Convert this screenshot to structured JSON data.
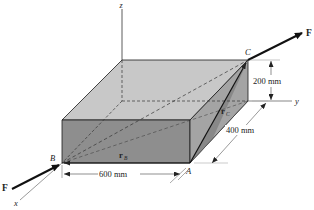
{
  "figure": {
    "type": "3D statics vector diagram"
  },
  "axes": {
    "x_label": "x",
    "y_label": "y",
    "z_label": "z"
  },
  "points": {
    "A": "A",
    "B": "B",
    "C": "C"
  },
  "vectors": {
    "rB_main": "r",
    "rB_sub": "B",
    "rC_main": "r",
    "rC_sub": "C"
  },
  "forces": {
    "top_label": "F",
    "bottom_label": "F"
  },
  "dimensions": {
    "width": "600 mm",
    "depth": "400 mm",
    "height": "200 mm"
  },
  "colors": {
    "top_face": "#c8c8c8",
    "front_face": "#8e8e8e",
    "right_face": "#a4a4a4",
    "triangle_face": "#7a7a7a",
    "lines": "#1a1a1a",
    "dim_lines": "#444444"
  }
}
